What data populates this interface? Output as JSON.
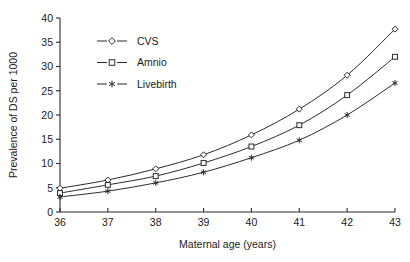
{
  "chart_data": {
    "type": "line",
    "title": "",
    "xlabel": "Maternal age (years)",
    "ylabel": "Prevalence of DS per 1000",
    "x": [
      36,
      37,
      38,
      39,
      40,
      41,
      42,
      43
    ],
    "xticklabels": [
      "36",
      "37",
      "38",
      "39",
      "40",
      "41",
      "42",
      "43"
    ],
    "yticklabels": [
      "0",
      "5",
      "10",
      "15",
      "20",
      "25",
      "30",
      "35",
      "40"
    ],
    "yticks": [
      0,
      5,
      10,
      15,
      20,
      25,
      30,
      35,
      40
    ],
    "xlim": [
      36,
      43
    ],
    "ylim": [
      0,
      40
    ],
    "grid": false,
    "legend_position": "upper-left-inside",
    "series": [
      {
        "name": "CVS",
        "marker": "diamond",
        "values": [
          4.9,
          6.6,
          8.9,
          11.8,
          15.9,
          21.2,
          28.2,
          37.7
        ]
      },
      {
        "name": "Amnio",
        "marker": "square",
        "values": [
          3.9,
          5.6,
          7.4,
          10.1,
          13.5,
          17.9,
          24.1,
          32.0
        ]
      },
      {
        "name": "Livebirth",
        "marker": "star",
        "values": [
          3.1,
          4.3,
          6.0,
          8.2,
          11.2,
          14.8,
          20.0,
          26.6
        ]
      }
    ]
  },
  "colors": {
    "axis": "#2b2b2b",
    "line": "#2b2b2b",
    "marker_fill": "#ffffff",
    "background": "#ffffff"
  },
  "legend": {
    "items": [
      {
        "label": "CVS",
        "marker": "diamond"
      },
      {
        "label": "Amnio",
        "marker": "square"
      },
      {
        "label": "Livebirth",
        "marker": "star"
      }
    ]
  }
}
